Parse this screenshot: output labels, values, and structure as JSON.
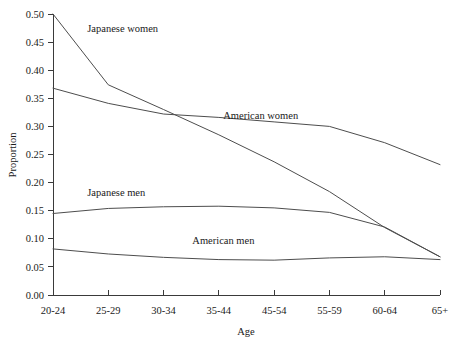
{
  "chart_data": {
    "type": "line",
    "title": "",
    "xlabel": "Age",
    "ylabel": "Proportion",
    "categories": [
      "20-24",
      "25-29",
      "30-34",
      "35-44",
      "45-54",
      "55-59",
      "60-64",
      "65+"
    ],
    "ylim": [
      0.0,
      0.5
    ],
    "yticks": [
      "0.00",
      "0.05",
      "0.10",
      "0.15",
      "0.20",
      "0.25",
      "0.30",
      "0.35",
      "0.40",
      "0.45",
      "0.50"
    ],
    "ytick_values": [
      0.0,
      0.05,
      0.1,
      0.15,
      0.2,
      0.25,
      0.3,
      0.35,
      0.4,
      0.45,
      0.5
    ],
    "grid": false,
    "legend_position": "inline-labels",
    "series": [
      {
        "name": "Japanese women",
        "label": "Japanese women",
        "color": "#4d4d4d",
        "values": [
          0.5,
          0.374,
          0.33,
          0.285,
          0.237,
          0.184,
          0.12,
          0.068
        ],
        "label_x": 0.62,
        "label_y": 0.468
      },
      {
        "name": "American women",
        "label": "American women",
        "color": "#4d4d4d",
        "values": [
          0.368,
          0.341,
          0.322,
          0.316,
          0.308,
          0.3,
          0.271,
          0.232
        ],
        "label_x": 3.08,
        "label_y": 0.314
      },
      {
        "name": "Japanese men",
        "label": "Japanese men",
        "color": "#4d4d4d",
        "values": [
          0.145,
          0.154,
          0.157,
          0.158,
          0.155,
          0.147,
          0.121,
          0.068
        ],
        "label_x": 0.62,
        "label_y": 0.176
      },
      {
        "name": "American men",
        "label": "American men",
        "color": "#4d4d4d",
        "values": [
          0.082,
          0.073,
          0.067,
          0.063,
          0.062,
          0.066,
          0.068,
          0.063
        ],
        "label_x": 2.52,
        "label_y": 0.09
      }
    ]
  },
  "axis": {
    "y_title": "Proportion",
    "x_title": "Age"
  }
}
